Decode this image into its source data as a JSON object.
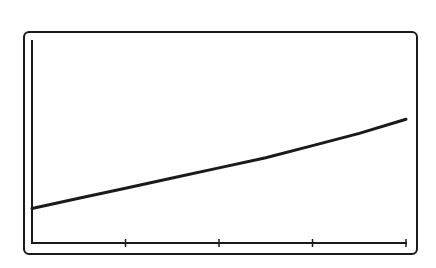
{
  "chart_data": {
    "type": "line",
    "title": "",
    "xlabel": "",
    "ylabel": "",
    "x_ticks": [
      0,
      1,
      2,
      3,
      4
    ],
    "tick_labels": [],
    "grid": false,
    "legend": null,
    "xlim": [
      0,
      4
    ],
    "ylim": [
      0,
      1
    ],
    "series": [
      {
        "name": "curve",
        "x": [
          0,
          0.5,
          1,
          1.5,
          2,
          2.5,
          3,
          3.5,
          4
        ],
        "y": [
          0.17,
          0.22,
          0.27,
          0.32,
          0.37,
          0.42,
          0.48,
          0.54,
          0.61
        ]
      }
    ],
    "colors": {
      "line": "#1a1a1a",
      "axis": "#1a1a1a",
      "frame": "#1a1a1a",
      "background": "#ffffff"
    }
  }
}
